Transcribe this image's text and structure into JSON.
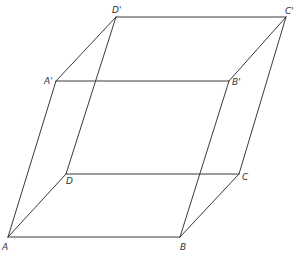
{
  "figure": {
    "type": "parallelepiped",
    "stroke_color": "#3a3a3a",
    "label_color": "#333333"
  },
  "vertices": {
    "A": {
      "label": "A",
      "x": 8,
      "y": 237,
      "lx": 2,
      "ly": 250
    },
    "B": {
      "label": "B",
      "x": 180,
      "y": 237,
      "lx": 180,
      "ly": 250
    },
    "C": {
      "label": "C",
      "x": 239,
      "y": 174,
      "lx": 242,
      "ly": 180
    },
    "D": {
      "label": "D",
      "x": 66,
      "y": 174,
      "lx": 66,
      "ly": 184
    },
    "A1": {
      "label": "A'",
      "x": 56,
      "y": 81,
      "lx": 44,
      "ly": 84
    },
    "B1": {
      "label": "B'",
      "x": 229,
      "y": 81,
      "lx": 232,
      "ly": 85
    },
    "C1": {
      "label": "C'",
      "x": 286,
      "y": 17,
      "lx": 285,
      "ly": 14
    },
    "D1": {
      "label": "D'",
      "x": 116,
      "y": 17,
      "lx": 112,
      "ly": 13
    }
  },
  "edges": [
    [
      "A",
      "B"
    ],
    [
      "B",
      "C"
    ],
    [
      "C",
      "D"
    ],
    [
      "D",
      "A"
    ],
    [
      "A1",
      "B1"
    ],
    [
      "B1",
      "C1"
    ],
    [
      "C1",
      "D1"
    ],
    [
      "D1",
      "A1"
    ],
    [
      "A",
      "A1"
    ],
    [
      "B",
      "B1"
    ],
    [
      "C",
      "C1"
    ],
    [
      "D",
      "D1"
    ]
  ]
}
